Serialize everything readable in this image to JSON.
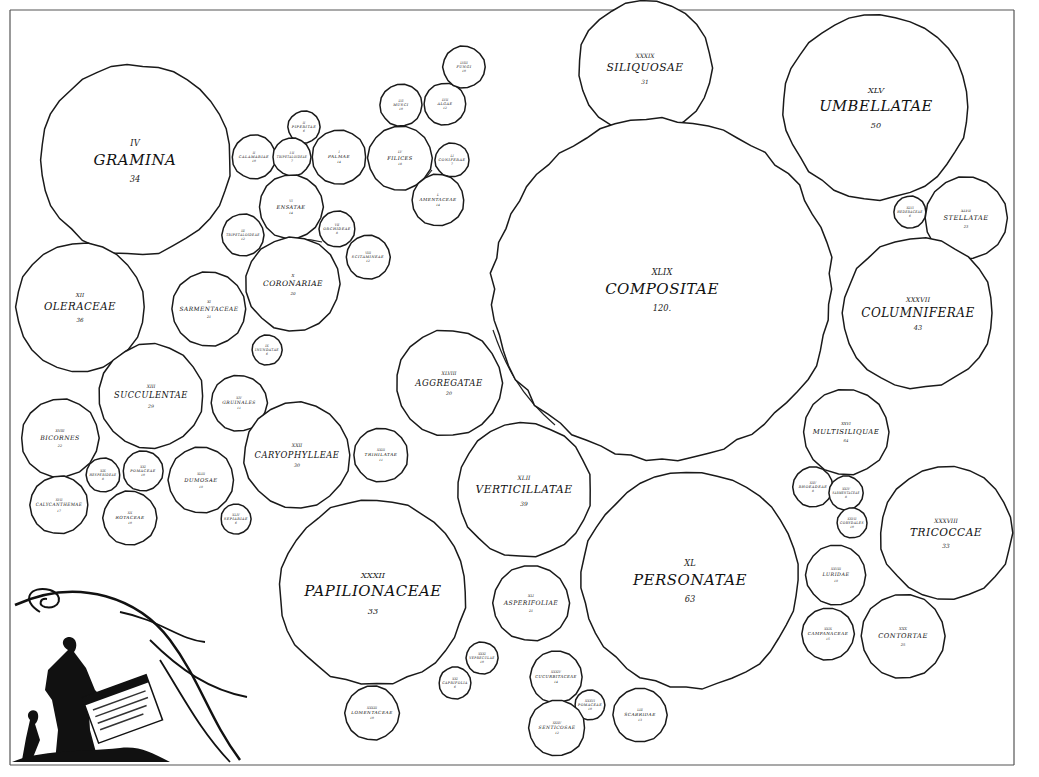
{
  "orders": [
    {
      "id": "graminae",
      "numeral": "IV",
      "name": "GRAMINA",
      "count": "34",
      "cx": 135,
      "cy": 160,
      "r": 95
    },
    {
      "id": "calamariae",
      "numeral": "II",
      "name": "CALAMARIAE",
      "count": "10",
      "cx": 254,
      "cy": 157,
      "r": 22
    },
    {
      "id": "piperitae",
      "numeral": "II",
      "name": "PIPERITAE",
      "count": "6",
      "cx": 304,
      "cy": 127,
      "r": 16
    },
    {
      "id": "trihilatae-lobbe",
      "numeral": "I  II",
      "name": "TRIPETALOIDEAE",
      "count": "7",
      "cx": 292,
      "cy": 157,
      "r": 19
    },
    {
      "id": "palmae",
      "numeral": "I",
      "name": "PALMAE",
      "count": "14",
      "cx": 339,
      "cy": 157,
      "r": 27
    },
    {
      "id": "filices",
      "numeral": "LV",
      "name": "FILICES",
      "count": "18",
      "cx": 400,
      "cy": 158,
      "r": 32
    },
    {
      "id": "musci",
      "numeral": "LVI",
      "name": "MUSCI",
      "count": "10",
      "cx": 401,
      "cy": 105,
      "r": 21
    },
    {
      "id": "algae",
      "numeral": "LVII",
      "name": "ALGAE",
      "count": "12",
      "cx": 445,
      "cy": 104,
      "r": 21
    },
    {
      "id": "fungi",
      "numeral": "LVIII",
      "name": "FUNGI",
      "count": "10",
      "cx": 464,
      "cy": 67,
      "r": 21
    },
    {
      "id": "coniferae",
      "numeral": "LI",
      "name": "CONIFERAE",
      "count": "7",
      "cx": 452,
      "cy": 160,
      "r": 17
    },
    {
      "id": "amentaceae",
      "numeral": "L",
      "name": "AMENTACEAE",
      "count": "14",
      "cx": 438,
      "cy": 200,
      "r": 26
    },
    {
      "id": "ensatae",
      "numeral": "VI",
      "name": "ENSATAE",
      "count": "14",
      "cx": 291,
      "cy": 207,
      "r": 32
    },
    {
      "id": "orchideae-left",
      "numeral": "III",
      "name": "TRIPETALOIDEAE",
      "count": "12",
      "cx": 243,
      "cy": 235,
      "r": 21
    },
    {
      "id": "scitamineae-top",
      "numeral": "VII",
      "name": "ORCHIDEAE",
      "count": "8",
      "cx": 337,
      "cy": 229,
      "r": 18
    },
    {
      "id": "scitamineae",
      "numeral": "VIII",
      "name": "SCITAMINEAE",
      "count": "12",
      "cx": 368,
      "cy": 257,
      "r": 22
    },
    {
      "id": "coronariae",
      "numeral": "X",
      "name": "CORONARIAE",
      "count": "20",
      "cx": 293,
      "cy": 284,
      "r": 47
    },
    {
      "id": "sarmentaceae",
      "numeral": "XI",
      "name": "SARMENTACEAE",
      "count": "21",
      "cx": 209,
      "cy": 309,
      "r": 37
    },
    {
      "id": "inundatae",
      "numeral": "IX",
      "name": "INUNDATAE",
      "count": "6",
      "cx": 267,
      "cy": 350,
      "r": 15
    },
    {
      "id": "oleraceae",
      "numeral": "XII",
      "name": "OLERACEAE",
      "count": "36",
      "cx": 80,
      "cy": 307,
      "r": 64
    },
    {
      "id": "succulentae",
      "numeral": "XIII",
      "name": "SUCCULENTAE",
      "count": "29",
      "cx": 151,
      "cy": 396,
      "r": 52
    },
    {
      "id": "gruinales",
      "numeral": "XIV",
      "name": "GRUINALES",
      "count": "11",
      "cx": 239,
      "cy": 403,
      "r": 28
    },
    {
      "id": "bicornes",
      "numeral": "XVIII",
      "name": "BICORNES",
      "count": "22",
      "cx": 60,
      "cy": 438,
      "r": 39
    },
    {
      "id": "calycanthemae",
      "numeral": "XVII",
      "name": "CALYCANTHEMAE",
      "count": "17",
      "cx": 59,
      "cy": 505,
      "r": 29
    },
    {
      "id": "hesperidae",
      "numeral": "XIX",
      "name": "HESPERIDEAE",
      "count": "8",
      "cx": 103,
      "cy": 475,
      "r": 17
    },
    {
      "id": "rotaceae",
      "numeral": "XXI",
      "name": "POMACEAE",
      "count": "10",
      "cx": 143,
      "cy": 471,
      "r": 20
    },
    {
      "id": "rotacea2",
      "numeral": "XX",
      "name": "ROTACEAE",
      "count": "10",
      "cx": 130,
      "cy": 518,
      "r": 27
    },
    {
      "id": "dumosae",
      "numeral": "XLIII",
      "name": "DUMOSAE",
      "count": "19",
      "cx": 201,
      "cy": 480,
      "r": 33
    },
    {
      "id": "sepiariae",
      "numeral": "XLIV",
      "name": "SEPIARIAE",
      "count": "6",
      "cx": 236,
      "cy": 519,
      "r": 15
    },
    {
      "id": "caryophylleae",
      "numeral": "XXII",
      "name": "CARYOPHYLLEAE",
      "count": "30",
      "cx": 297,
      "cy": 455,
      "r": 53
    },
    {
      "id": "trihilatae",
      "numeral": "XXIII",
      "name": "TRIHILATAE",
      "count": "11",
      "cx": 381,
      "cy": 455,
      "r": 27
    },
    {
      "id": "siliquosae",
      "numeral": "XXXIX",
      "name": "SILIQUOSAE",
      "count": "31",
      "cx": 645,
      "cy": 68,
      "r": 67
    },
    {
      "id": "umbellatae",
      "numeral": "XLV",
      "name": "UMBELLATAE",
      "count": "50",
      "cx": 876,
      "cy": 107,
      "r": 92
    },
    {
      "id": "hederaceae",
      "numeral": "XLVI",
      "name": "HEDERACEAE",
      "count": "6",
      "cx": 910,
      "cy": 212,
      "r": 16
    },
    {
      "id": "stellatae",
      "numeral": "XLVII",
      "name": "STELLATAE",
      "count": "23",
      "cx": 966,
      "cy": 218,
      "r": 41
    },
    {
      "id": "compositae",
      "numeral": "XLIX",
      "name": "COMPOSITAE",
      "count": "120.",
      "cx": 662,
      "cy": 289,
      "r": 170
    },
    {
      "id": "columniferae",
      "numeral": "XXXVII",
      "name": "COLUMNIFERAE",
      "count": "43",
      "cx": 918,
      "cy": 313,
      "r": 75
    },
    {
      "id": "aggregatae",
      "numeral": "XLVIII",
      "name": "AGGREGATAE",
      "count": "20",
      "cx": 449,
      "cy": 383,
      "r": 53
    },
    {
      "id": "multisiliquae",
      "numeral": "XXVI",
      "name": "MULTISILIQUAE",
      "count": "64",
      "cx": 846,
      "cy": 432,
      "r": 43
    },
    {
      "id": "verticillatae",
      "numeral": "XLII",
      "name": "VERTICILLATAE",
      "count": "39",
      "cx": 524,
      "cy": 490,
      "r": 67
    },
    {
      "id": "tricoccae",
      "numeral": "XXXVIII",
      "name": "TRICOCCAE",
      "count": "33",
      "cx": 946,
      "cy": 533,
      "r": 66
    },
    {
      "id": "personatae",
      "numeral": "XL",
      "name": "PERSONATAE",
      "count": "63",
      "cx": 690,
      "cy": 580,
      "r": 108
    },
    {
      "id": "rhoeadeae",
      "numeral": "XXV",
      "name": "RHOEADEAE",
      "count": "8",
      "cx": 813,
      "cy": 487,
      "r": 20
    },
    {
      "id": "sarmentaceae2",
      "numeral": "XXIV",
      "name": "SARMENTACEAE",
      "count": "8",
      "cx": 846,
      "cy": 493,
      "r": 17
    },
    {
      "id": "cucurbitaceae-r",
      "numeral": "XXVII",
      "name": "CORYDALES",
      "count": "10",
      "cx": 852,
      "cy": 523,
      "r": 15
    },
    {
      "id": "luridae",
      "numeral": "XXVIII",
      "name": "LURIDAE",
      "count": "19",
      "cx": 836,
      "cy": 575,
      "r": 30
    },
    {
      "id": "campanaceae",
      "numeral": "XXIX",
      "name": "CAMPANACEAE",
      "count": "15",
      "cx": 828,
      "cy": 634,
      "r": 26
    },
    {
      "id": "contortae",
      "numeral": "XXX",
      "name": "CONTORTAE",
      "count": "25",
      "cx": 903,
      "cy": 636,
      "r": 42
    },
    {
      "id": "papilionaceae",
      "numeral": "XXXII",
      "name": "PAPILIONACEAE",
      "count": "33",
      "cx": 373,
      "cy": 592,
      "r": 93
    },
    {
      "id": "asperifoliae",
      "numeral": "XLI",
      "name": "ASPERIFOLIAE",
      "count": "21",
      "cx": 531,
      "cy": 603,
      "r": 38
    },
    {
      "id": "vepreculae",
      "numeral": "XXXI",
      "name": "VEPRECULAE",
      "count": "10",
      "cx": 482,
      "cy": 658,
      "r": 16
    },
    {
      "id": "caprifolia",
      "numeral": "XXI",
      "name": "CAPRIFOLIA",
      "count": "6",
      "cx": 455,
      "cy": 683,
      "r": 16
    },
    {
      "id": "lomentaceae",
      "numeral": "XXXIII",
      "name": "LOMENTACEAE",
      "count": "10",
      "cx": 372,
      "cy": 713,
      "r": 27
    },
    {
      "id": "cucurbitaceae",
      "numeral": "XXXIV",
      "name": "CUCURBITACEAE",
      "count": "14",
      "cx": 556,
      "cy": 677,
      "r": 26
    },
    {
      "id": "pomaceae",
      "numeral": "XXXVI",
      "name": "POMACEAE",
      "count": "10",
      "cx": 590,
      "cy": 705,
      "r": 15
    },
    {
      "id": "senticosae",
      "numeral": "XXXV",
      "name": "SENTICOSAE",
      "count": "12",
      "cx": 557,
      "cy": 728,
      "r": 28
    },
    {
      "id": "scabridae",
      "numeral": "LIII",
      "name": "SCABRIDAE",
      "count": "13",
      "cx": 640,
      "cy": 715,
      "r": 27
    }
  ],
  "ornament": {
    "description": "Allegorical figure of Flora holding a chart with decorative flourishes",
    "scroll_label": "TABULA"
  }
}
